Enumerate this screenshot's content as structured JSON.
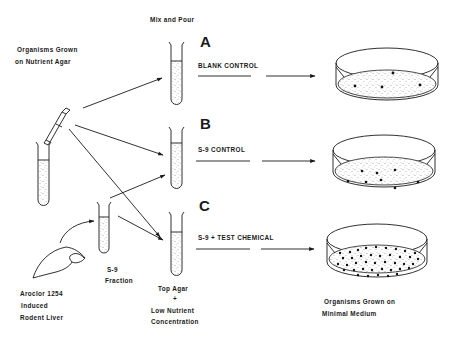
{
  "diagram": {
    "labels": {
      "mix_and_pour": "Mix and Pour",
      "organisms_grown_line1": "Organisms Grown",
      "organisms_grown_line2": "on Nutrient Agar",
      "aroclor_line1": "Aroclor 1254",
      "aroclor_line2": "Induced",
      "aroclor_line3": "Rodent Liver",
      "s9_line1": "S-9",
      "s9_line2": "Fraction",
      "top_agar_line1": "Top Agar",
      "top_agar_plus": "+",
      "top_agar_line2": "Low Nutrient",
      "top_agar_line3": "Concentration",
      "result_line1": "Organisms  Grown on",
      "result_line2": "Minimal Medium"
    },
    "conditions": [
      {
        "letter": "A",
        "label": "BLANK CONTROL",
        "colonies": 4
      },
      {
        "letter": "B",
        "label": "S-9 CONTROL",
        "colonies": 8
      },
      {
        "letter": "C",
        "label": "S-9 + TEST CHEMICAL",
        "colonies": 40
      }
    ],
    "colors": {
      "ink": "#1a1a1a",
      "background": "#ffffff"
    }
  }
}
